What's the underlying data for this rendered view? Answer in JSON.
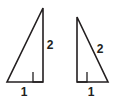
{
  "figure": {
    "background_color": "#ffffff",
    "stroke_color": "#231f20",
    "width": 117,
    "height": 101
  },
  "triangles": [
    {
      "name": "left-triangle",
      "orientation": "right angle at bottom-right",
      "vertices": {
        "apex": [
          43,
          8
        ],
        "bottom_left": [
          7,
          82
        ],
        "bottom_right": [
          43,
          82
        ]
      },
      "right_angle_marker": {
        "x": 33,
        "y": 72,
        "size": 10,
        "corner": "bottom-right"
      },
      "labels": {
        "base": "1",
        "base_pos": [
          24,
          93
        ],
        "vertical": "2",
        "vertical_pos": [
          50,
          46
        ]
      }
    },
    {
      "name": "right-triangle",
      "orientation": "right angle at bottom-left",
      "vertices": {
        "apex": [
          77,
          17
        ],
        "bottom_left": [
          77,
          82
        ],
        "bottom_right": [
          108,
          82
        ]
      },
      "right_angle_marker": {
        "x": 77,
        "y": 72,
        "size": 10,
        "corner": "bottom-left"
      },
      "labels": {
        "base": "1",
        "base_pos": [
          91,
          93
        ],
        "hypotenuse": "2",
        "hypotenuse_pos": [
          100,
          50
        ]
      }
    }
  ]
}
